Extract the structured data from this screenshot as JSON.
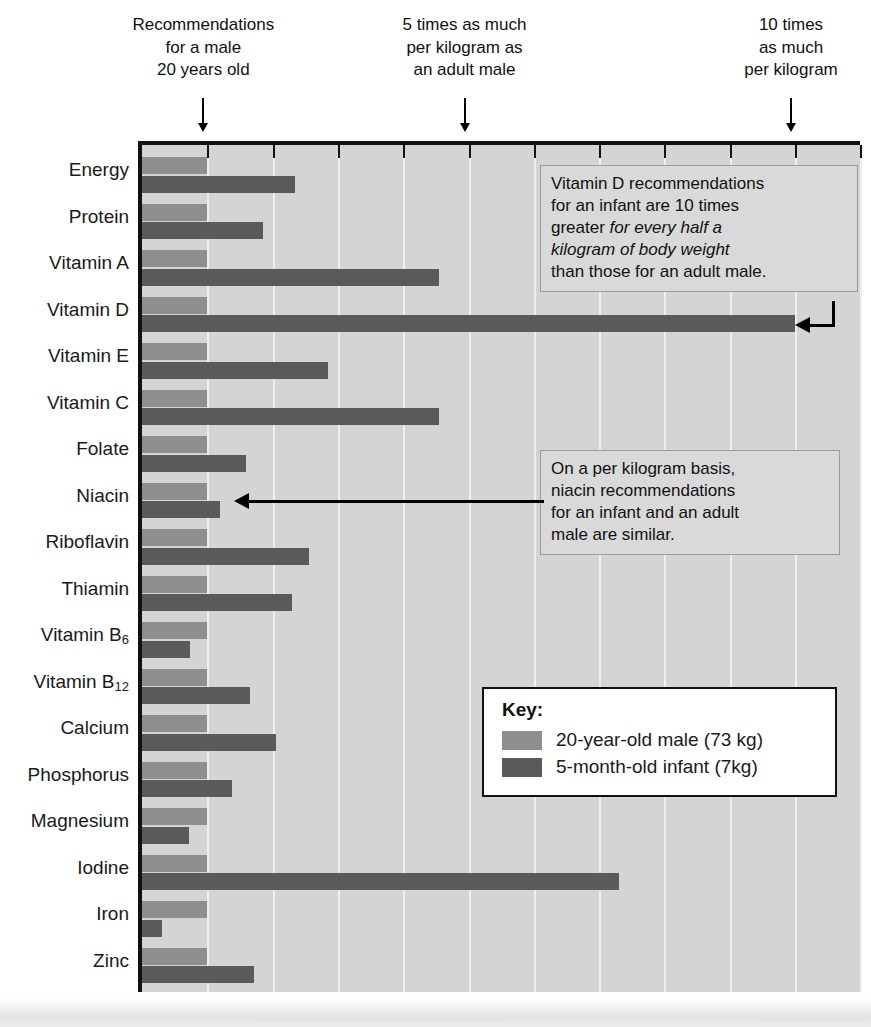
{
  "top_notes": [
    {
      "lines": [
        "Recommendations",
        "for a male",
        "20 years old"
      ],
      "value": 1
    },
    {
      "lines": [
        "5 times as much",
        "per kilogram as",
        "an adult male"
      ],
      "value": 5
    },
    {
      "lines": [
        "10 times",
        "as much",
        "per kilogram"
      ],
      "value": 10
    }
  ],
  "key": {
    "title": "Key:",
    "entries": [
      {
        "label": "20-year-old male (73 kg)",
        "color": "#8e8e8e"
      },
      {
        "label": "5-month-old infant (7kg)",
        "color": "#5a5a5a"
      }
    ]
  },
  "callouts": [
    {
      "name": "vitamin-d-callout",
      "lines": [
        {
          "text": "Vitamin D recommendations",
          "italic": false
        },
        {
          "text": "for an infant are 10 times",
          "italic": false
        },
        {
          "pre": "greater ",
          "text": "for every half a",
          "italic": true
        },
        {
          "text": "kilogram of body weight",
          "italic": true
        },
        {
          "text": "than those for an adult male.",
          "italic": false
        }
      ]
    },
    {
      "name": "niacin-callout",
      "lines": [
        {
          "text": "On a per kilogram basis,",
          "italic": false
        },
        {
          "text": "niacin recommendations",
          "italic": false
        },
        {
          "text": "for an infant and an adult",
          "italic": false
        },
        {
          "text": "male are similar.",
          "italic": false
        }
      ]
    }
  ],
  "chart_data": {
    "type": "bar",
    "title": "",
    "xlabel": "",
    "ylabel": "",
    "orientation": "horizontal",
    "xlim": [
      0,
      11
    ],
    "xunit": "multiple of adult-male recommendation per kilogram",
    "xticks": [
      1,
      2,
      3,
      4,
      5,
      6,
      7,
      8,
      9,
      10,
      11
    ],
    "grid": true,
    "legend_position": "inside-right",
    "categories": [
      "Energy",
      "Protein",
      "Vitamin A",
      "Vitamin D",
      "Vitamin E",
      "Vitamin C",
      "Folate",
      "Niacin",
      "Riboflavin",
      "Thiamin",
      "Vitamin B₆",
      "Vitamin B₁₂",
      "Calcium",
      "Phosphorus",
      "Magnesium",
      "Iodine",
      "Iron",
      "Zinc"
    ],
    "category_labels_html": [
      "Energy",
      "Protein",
      "Vitamin A",
      "Vitamin D",
      "Vitamin E",
      "Vitamin C",
      "Folate",
      "Niacin",
      "Riboflavin",
      "Thiamin",
      "Vitamin B<sub>6</sub>",
      "Vitamin B<sub>12</sub>",
      "Calcium",
      "Phosphorus",
      "Magnesium",
      "Iodine",
      "Iron",
      "Zinc"
    ],
    "series": [
      {
        "name": "20-year-old male (73 kg)",
        "color": "#8e8e8e",
        "values": [
          1,
          1,
          1,
          1,
          1,
          1,
          1,
          1,
          1,
          1,
          1,
          1,
          1,
          1,
          1,
          1,
          1,
          1
        ]
      },
      {
        "name": "5-month-old infant (7kg)",
        "color": "#5a5a5a",
        "values": [
          2.35,
          1.85,
          4.55,
          10.0,
          2.85,
          4.55,
          1.6,
          1.2,
          2.55,
          2.3,
          0.73,
          1.65,
          2.05,
          1.38,
          0.72,
          7.3,
          0.31,
          1.72
        ]
      }
    ]
  }
}
